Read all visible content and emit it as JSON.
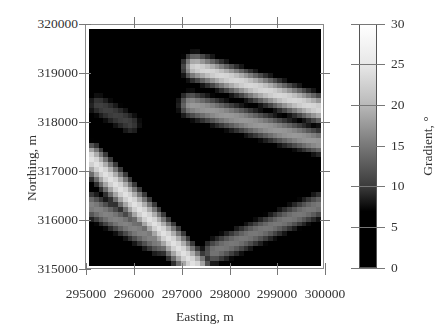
{
  "chart_data": {
    "type": "heatmap",
    "title": "",
    "xlabel": "Easting, m",
    "ylabel": "Northing, m",
    "colorbar_label": "Gradient, °",
    "xlim": [
      295000,
      300000
    ],
    "ylim": [
      315000,
      320000
    ],
    "x_ticks": [
      "295000",
      "296000",
      "297000",
      "298000",
      "299000",
      "300000"
    ],
    "y_ticks": [
      "320000",
      "319000",
      "318000",
      "317000",
      "316000",
      "315000"
    ],
    "colorbar_range": [
      0,
      30
    ],
    "colorbar_ticks": [
      "30",
      "25",
      "20",
      "15",
      "10",
      "5",
      "0"
    ],
    "colormap": "grayscale (black below ~7°, white at 30°)",
    "grid_cells": [
      48,
      48
    ],
    "features": [
      {
        "description": "NW-SE ridge band, upper right",
        "from": [
          297300,
          319200
        ],
        "to": [
          300000,
          318300
        ],
        "peak_gradient": 26
      },
      {
        "description": "parallel lower band, upper right",
        "from": [
          297200,
          318400
        ],
        "to": [
          300000,
          317600
        ],
        "peak_gradient": 20
      },
      {
        "description": "ridge band, lower left curving to bottom center",
        "from": [
          295000,
          317300
        ],
        "to": [
          297300,
          315000
        ],
        "peak_gradient": 27
      },
      {
        "description": "secondary band, lower left",
        "from": [
          295000,
          316300
        ],
        "to": [
          296500,
          315500
        ],
        "peak_gradient": 18
      },
      {
        "description": "diagonal band, lower right",
        "from": [
          297700,
          315300
        ],
        "to": [
          300000,
          316300
        ],
        "peak_gradient": 17
      },
      {
        "description": "small patch, upper left",
        "from": [
          295200,
          318400
        ],
        "to": [
          295900,
          318000
        ],
        "peak_gradient": 12
      }
    ]
  },
  "labels": {
    "xlabel": "Easting, m",
    "ylabel": "Northing, m",
    "cbar_label": "Gradient, °",
    "x": [
      "295000",
      "296000",
      "297000",
      "298000",
      "299000",
      "300000"
    ],
    "y": [
      "320000",
      "319000",
      "318000",
      "317000",
      "316000",
      "315000"
    ],
    "cb": [
      "30",
      "25",
      "20",
      "15",
      "10",
      "5",
      "0"
    ]
  }
}
